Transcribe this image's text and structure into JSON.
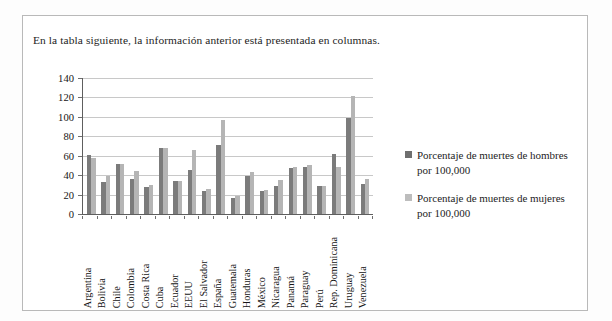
{
  "document": {
    "caption": "En la tabla siguiente, la información anterior está presentada en columnas."
  },
  "colors": {
    "men_bar": "#7b7b7b",
    "women_bar": "#b5b5b5",
    "axis": "#5e5e5e",
    "gridline": "#c8c8c8",
    "frame": "#b9b9b9",
    "text": "#1a1a1a"
  },
  "legend": {
    "position": "right",
    "items": [
      {
        "label": "Porcentaje de muertes de hombres por 100,000",
        "color": "#6f6f6f"
      },
      {
        "label": "Porcentaje de muertes de mujeres por 100,000",
        "color": "#bdbdbd"
      }
    ]
  },
  "chart_data": {
    "type": "bar",
    "title": "",
    "xlabel": "",
    "ylabel": "",
    "ylim": [
      0,
      140
    ],
    "yticks": [
      0,
      20,
      40,
      60,
      80,
      100,
      120,
      140
    ],
    "grid": true,
    "legend_position": "right",
    "categories": [
      "Argentina",
      "Bolivia",
      "Chile",
      "Colombia",
      "Costa Rica",
      "Cuba",
      "Ecuador",
      "EEUU",
      "El Salvador",
      "España",
      "Guatemala",
      "Honduras",
      "México",
      "Nicaragua",
      "Panamá",
      "Paraguay",
      "Perú",
      "Rep. Dominicana",
      "Uruguay",
      "Venezuela"
    ],
    "series": [
      {
        "name": "Porcentaje de muertes de hombres por 100,000",
        "color": "#7b7b7b",
        "values": [
          61,
          33,
          51,
          36,
          28,
          68,
          34,
          45,
          24,
          71,
          17,
          39,
          24,
          29,
          47,
          48,
          29,
          62,
          99,
          31
        ]
      },
      {
        "name": "Porcentaje de muertes de mujeres por 100,000",
        "color": "#b5b5b5",
        "values": [
          58,
          39,
          52,
          44,
          30,
          68,
          34,
          66,
          26,
          97,
          19,
          43,
          25,
          35,
          48,
          50,
          29,
          48,
          121,
          36
        ]
      }
    ]
  }
}
